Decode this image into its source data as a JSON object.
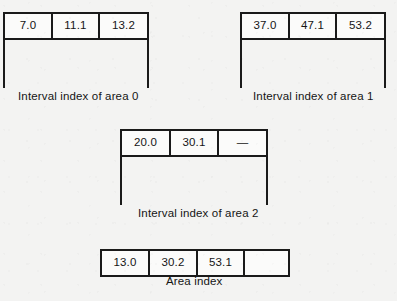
{
  "figure": {
    "background_color": "#f3f3f2",
    "line_color": "#1a1a1a",
    "text_color": "#151515",
    "empty_cell_marker": "—"
  },
  "nodes": [
    {
      "id": "interval-index-area-0",
      "caption": "Interval index of area 0",
      "cells": [
        "7.0",
        "11.1",
        "13.2"
      ],
      "has_legs": true
    },
    {
      "id": "interval-index-area-1",
      "caption": "Interval index of area 1",
      "cells": [
        "37.0",
        "47.1",
        "53.2"
      ],
      "has_legs": true
    },
    {
      "id": "interval-index-area-2",
      "caption": "Interval index of area 2",
      "cells": [
        "20.0",
        "30.1",
        "—"
      ],
      "has_legs": true
    },
    {
      "id": "area-index",
      "caption": "Area index",
      "cells": [
        "13.0",
        "30.2",
        "53.1",
        ""
      ],
      "has_legs": false
    }
  ]
}
